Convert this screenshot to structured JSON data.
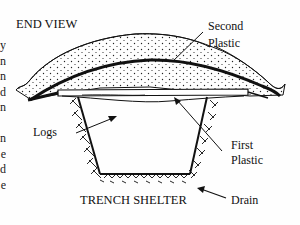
{
  "diagram": {
    "title": "END VIEW",
    "caption": "TRENCH SHELTER",
    "labels": {
      "second_plastic_line1": "Second",
      "second_plastic_line2": "Plastic",
      "first_plastic_line1": "First",
      "first_plastic_line2": "Plastic",
      "logs": "Logs",
      "drain": "Drain"
    },
    "cut_off_left_text": [
      "y",
      "n",
      "n",
      "d",
      "n",
      "",
      "n",
      "e",
      "d",
      "e"
    ],
    "colors": {
      "ink": "#111111",
      "background": "#fefefe"
    }
  }
}
